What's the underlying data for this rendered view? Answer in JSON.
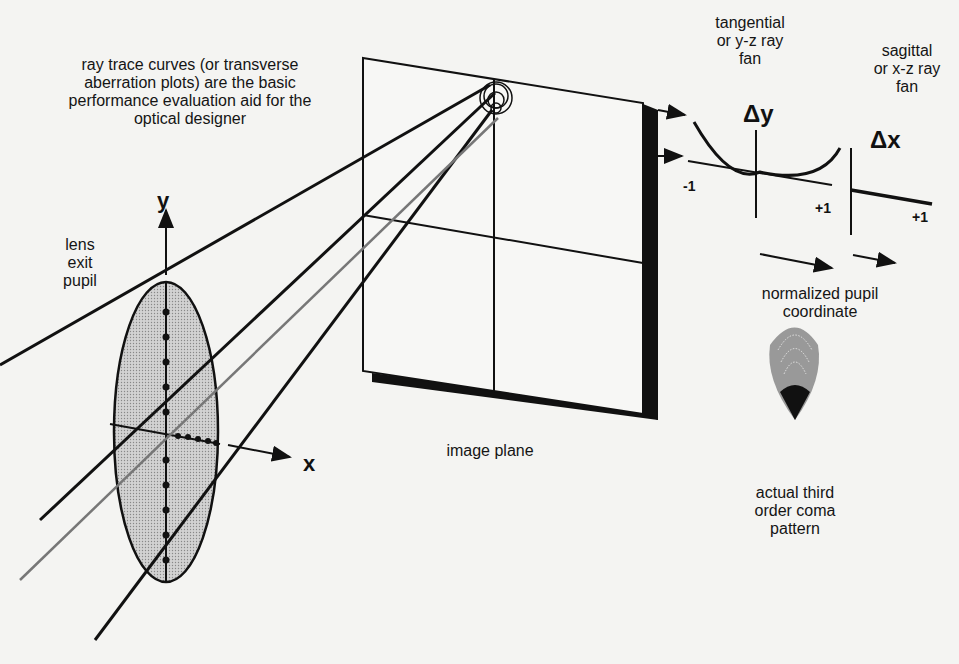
{
  "caption": {
    "line1": "ray trace curves (or transverse",
    "line2": "aberration plots) are the basic",
    "line3": "performance evaluation aid for the",
    "line4": "optical designer"
  },
  "pupil": {
    "line1": "lens",
    "line2": "exit",
    "line3": "pupil",
    "y_axis": "y",
    "x_axis": "x"
  },
  "image_plane": {
    "label": "image plane"
  },
  "tangential": {
    "line1": "tangential",
    "line2": "or y-z ray",
    "line3": "fan",
    "axis": "Δy",
    "minus": "-1",
    "plus": "+1"
  },
  "sagittal": {
    "line1": "sagittal",
    "line2": "or x-z ray",
    "line3": "fan",
    "axis": "Δx",
    "plus": "+1"
  },
  "pupil_coordinate": {
    "line1": "normalized pupil",
    "line2": "coordinate"
  },
  "coma": {
    "line1": "actual third",
    "line2": "order coma",
    "line3": "pattern"
  },
  "colors": {
    "ink": "#111111",
    "paper": "#f4f4f2",
    "shade": "#c8c8c8"
  }
}
